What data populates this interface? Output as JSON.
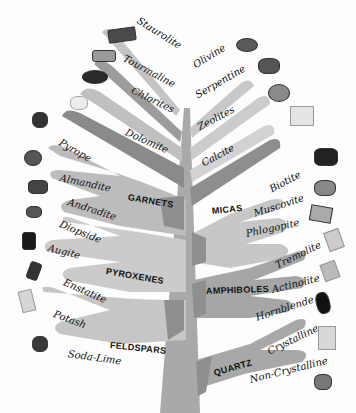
{
  "trunk_color": "#a9a9a9",
  "branch_colors": {
    "light": "#c9c9c9",
    "mid": "#b3b3b3",
    "dark": "#8a8a8a"
  },
  "top_left": [
    "Staurolite",
    "Tourmaline",
    "Chlorites",
    "Dolomite"
  ],
  "top_right": [
    "Olivine",
    "Serpentine",
    "Zeolites",
    "Calcite"
  ],
  "groups": {
    "garnets": {
      "name": "GARNETS",
      "members": [
        "Pyrope",
        "Almandite",
        "Andradite"
      ]
    },
    "pyroxenes": {
      "name": "PYROXENES",
      "members": [
        "Diopside",
        "Augite",
        "Enstatite"
      ]
    },
    "feldspars": {
      "name": "FELDSPARS",
      "members": [
        "Potash",
        "Soda-Lime"
      ]
    },
    "micas": {
      "name": "MICAS",
      "members": [
        "Biotite",
        "Muscovite",
        "Phlogopite"
      ]
    },
    "amphiboles": {
      "name": "AMPHIBOLES",
      "members": [
        "Tremolite",
        "Actinolite",
        "Hornblende"
      ]
    },
    "quartz": {
      "name": "QUARTZ",
      "members": [
        "Crystalline",
        "Non-Crystalline"
      ]
    }
  }
}
